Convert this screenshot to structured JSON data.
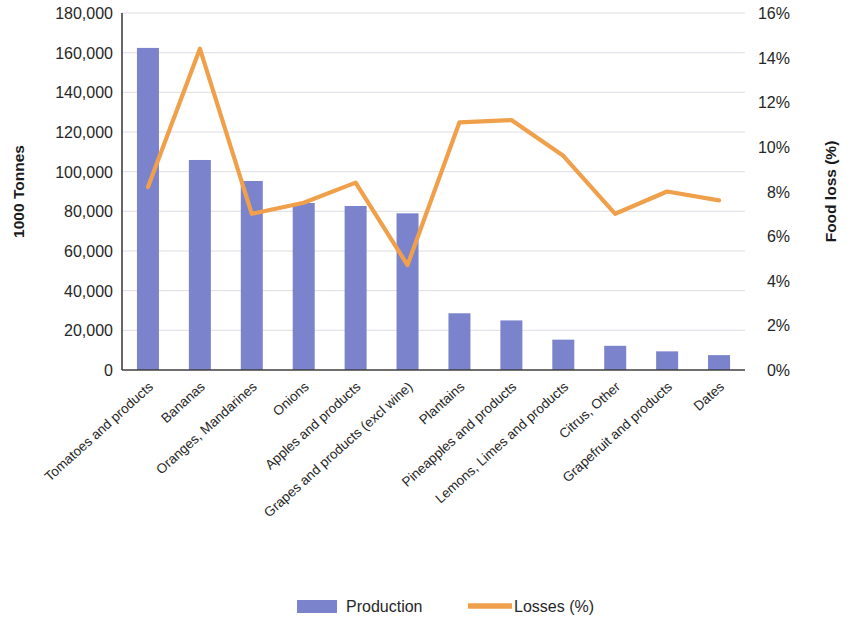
{
  "chart_data": {
    "type": "bar",
    "title": "",
    "subtitle": "",
    "xlabel": "",
    "ylabel": "1000 Tonnes",
    "y2label": "Food loss (%)",
    "ylim": [
      0,
      180000
    ],
    "y2lim": [
      0,
      16
    ],
    "grid": true,
    "legend_position": "bottom",
    "categories": [
      "Tomatoes and products",
      "Bananas",
      "Oranges, Mandarines",
      "Onions",
      "Apples and products",
      "Grapes and products (excl wine)",
      "Plantains",
      "Pineapples and products",
      "Lemons, Limes and products",
      "Citrus, Other",
      "Grapefruit and products",
      "Dates"
    ],
    "y_tick_labels": [
      "0",
      "20,000",
      "40,000",
      "60,000",
      "80,000",
      "100,000",
      "120,000",
      "140,000",
      "160,000",
      "180,000"
    ],
    "y_tick_values": [
      0,
      20000,
      40000,
      60000,
      80000,
      100000,
      120000,
      140000,
      160000,
      180000
    ],
    "y2_tick_labels": [
      "0%",
      "2%",
      "4%",
      "6%",
      "8%",
      "10%",
      "12%",
      "14%",
      "16%"
    ],
    "y2_tick_values": [
      0,
      2,
      4,
      6,
      8,
      10,
      12,
      14,
      16
    ],
    "series": [
      {
        "name": "Production",
        "type": "bar",
        "axis": "left",
        "color": "#7b83cc",
        "values": [
          162400,
          105900,
          95300,
          84200,
          82700,
          79000,
          28600,
          25000,
          15300,
          12200,
          9400,
          7500
        ]
      },
      {
        "name": "Losses (%)",
        "type": "line",
        "axis": "right",
        "color": "#f0a04b",
        "values": [
          8.2,
          14.4,
          7.0,
          7.5,
          8.4,
          4.7,
          11.1,
          11.2,
          9.6,
          7.0,
          8.0,
          7.6
        ]
      }
    ]
  },
  "legend": {
    "items": [
      {
        "label": "Production",
        "marker": "bar-swatch",
        "color": "#7b83cc"
      },
      {
        "label": "Losses (%)",
        "marker": "line-swatch",
        "color": "#f0a04b"
      }
    ]
  }
}
